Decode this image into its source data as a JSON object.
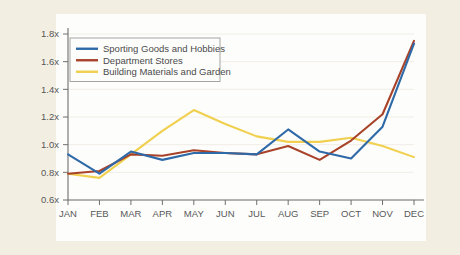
{
  "figure": {
    "page_background": "#f2efe2",
    "plot_background": "#fdfdfb"
  },
  "chart_data": {
    "type": "line",
    "title": "",
    "xlabel": "",
    "ylabel": "",
    "categories": [
      "JAN",
      "FEB",
      "MAR",
      "APR",
      "MAY",
      "JUN",
      "JUL",
      "AUG",
      "SEP",
      "OCT",
      "NOV",
      "DEC"
    ],
    "ylim": [
      0.6,
      1.8
    ],
    "ytick_values": [
      0.6,
      0.8,
      1.0,
      1.2,
      1.4,
      1.6,
      1.8
    ],
    "ytick_labels": [
      "0.6x",
      "0.8x",
      "1.0x",
      "1.2x",
      "1.4x",
      "1.6x",
      "1.8x"
    ],
    "grid": false,
    "legend_position": "upper-left-inside",
    "series": [
      {
        "name": "Sporting Goods and Hobbies",
        "color": "#2f6aa8",
        "values": [
          0.93,
          0.79,
          0.95,
          0.89,
          0.94,
          0.94,
          0.93,
          1.11,
          0.95,
          0.9,
          1.13,
          1.73
        ]
      },
      {
        "name": "Department Stores",
        "color": "#a8432a",
        "values": [
          0.79,
          0.81,
          0.93,
          0.92,
          0.96,
          0.94,
          0.93,
          0.99,
          0.89,
          1.03,
          1.22,
          1.75
        ]
      },
      {
        "name": "Building Materials and Garden",
        "color": "#f0d04e",
        "values": [
          0.79,
          0.76,
          0.93,
          1.1,
          1.25,
          1.15,
          1.06,
          1.02,
          1.02,
          1.05,
          0.99,
          0.91
        ]
      }
    ]
  }
}
